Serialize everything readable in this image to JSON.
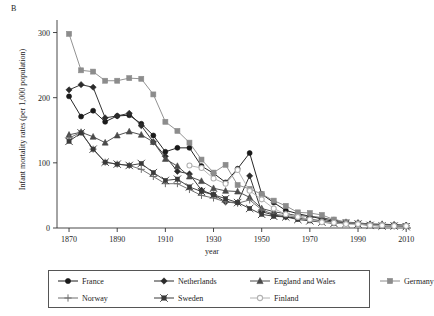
{
  "panel": {
    "label": "B"
  },
  "chart_data": {
    "type": "line",
    "title": "",
    "xlabel": "year",
    "ylabel": "Infant mortality rates (per 1,000 population)",
    "xlim": [
      1865,
      2012
    ],
    "ylim": [
      0,
      310
    ],
    "xticks": [
      1870,
      1890,
      1910,
      1930,
      1950,
      1970,
      1990,
      2010
    ],
    "yticks": [
      0,
      100,
      200,
      300
    ],
    "grid": false,
    "legend_position": "bottom",
    "x": [
      1870,
      1875,
      1880,
      1885,
      1890,
      1895,
      1900,
      1905,
      1910,
      1915,
      1920,
      1925,
      1930,
      1935,
      1940,
      1945,
      1950,
      1955,
      1960,
      1965,
      1970,
      1975,
      1980,
      1985,
      1990,
      1995,
      2000,
      2005,
      2010
    ],
    "series": [
      {
        "name": "France",
        "marker": "circle-filled",
        "color": "#1a1a1a",
        "values": [
          202,
          171,
          180,
          163,
          172,
          173,
          160,
          142,
          117,
          123,
          123,
          95,
          84,
          70,
          91,
          115,
          52,
          39,
          27,
          22,
          18,
          14,
          10,
          8,
          7,
          5,
          4,
          4,
          4
        ]
      },
      {
        "name": "Netherlands",
        "marker": "diamond-filled",
        "color": "#2b2b2b",
        "values": [
          212,
          220,
          216,
          169,
          172,
          176,
          157,
          132,
          110,
          87,
          83,
          58,
          51,
          40,
          39,
          80,
          25,
          20,
          17,
          15,
          13,
          11,
          9,
          8,
          7,
          6,
          5,
          5,
          4
        ]
      },
      {
        "name": "England and Wales",
        "marker": "triangle-filled",
        "color": "#4a4a4a",
        "values": [
          143,
          147,
          140,
          131,
          142,
          148,
          143,
          132,
          106,
          95,
          79,
          72,
          61,
          57,
          56,
          47,
          30,
          25,
          22,
          19,
          18,
          16,
          12,
          9,
          8,
          6,
          6,
          5,
          4
        ]
      },
      {
        "name": "Germany",
        "marker": "square-filled",
        "color": "#8c8c8c",
        "values": [
          298,
          242,
          240,
          226,
          226,
          230,
          229,
          205,
          163,
          149,
          131,
          105,
          85,
          97,
          66,
          60,
          52,
          42,
          34,
          24,
          23,
          20,
          13,
          9,
          7,
          5,
          4,
          4,
          3
        ]
      },
      {
        "name": "Norway",
        "marker": "plus",
        "color": "#6e6e6e",
        "values": [
          138,
          147,
          121,
          101,
          98,
          96,
          90,
          79,
          68,
          68,
          59,
          50,
          46,
          40,
          38,
          43,
          28,
          21,
          19,
          17,
          13,
          11,
          8,
          8,
          7,
          4,
          4,
          3,
          3
        ]
      },
      {
        "name": "Sweden",
        "marker": "x-square",
        "color": "#3a3a3a",
        "values": [
          133,
          146,
          121,
          101,
          98,
          96,
          99,
          85,
          73,
          75,
          63,
          56,
          51,
          45,
          39,
          30,
          21,
          18,
          17,
          13,
          11,
          9,
          7,
          7,
          6,
          4,
          3,
          3,
          2
        ]
      },
      {
        "name": "Finland",
        "marker": "circle-open",
        "color": "#b2b2b2",
        "values": [
          null,
          null,
          null,
          null,
          null,
          null,
          null,
          null,
          null,
          null,
          96,
          92,
          76,
          68,
          89,
          57,
          44,
          30,
          21,
          17,
          13,
          9,
          8,
          6,
          6,
          4,
          4,
          3,
          3
        ]
      }
    ]
  },
  "legend": {
    "items": [
      {
        "label": "France",
        "marker": "circle-filled",
        "color": "#1a1a1a"
      },
      {
        "label": "Netherlands",
        "marker": "diamond-filled",
        "color": "#2b2b2b"
      },
      {
        "label": "England and Wales",
        "marker": "triangle-filled",
        "color": "#4a4a4a"
      },
      {
        "label": "Germany",
        "marker": "square-filled",
        "color": "#8c8c8c"
      },
      {
        "label": "Norway",
        "marker": "plus",
        "color": "#6e6e6e"
      },
      {
        "label": "Sweden",
        "marker": "x-square",
        "color": "#3a3a3a"
      },
      {
        "label": "Finland",
        "marker": "circle-open",
        "color": "#b2b2b2"
      }
    ]
  }
}
